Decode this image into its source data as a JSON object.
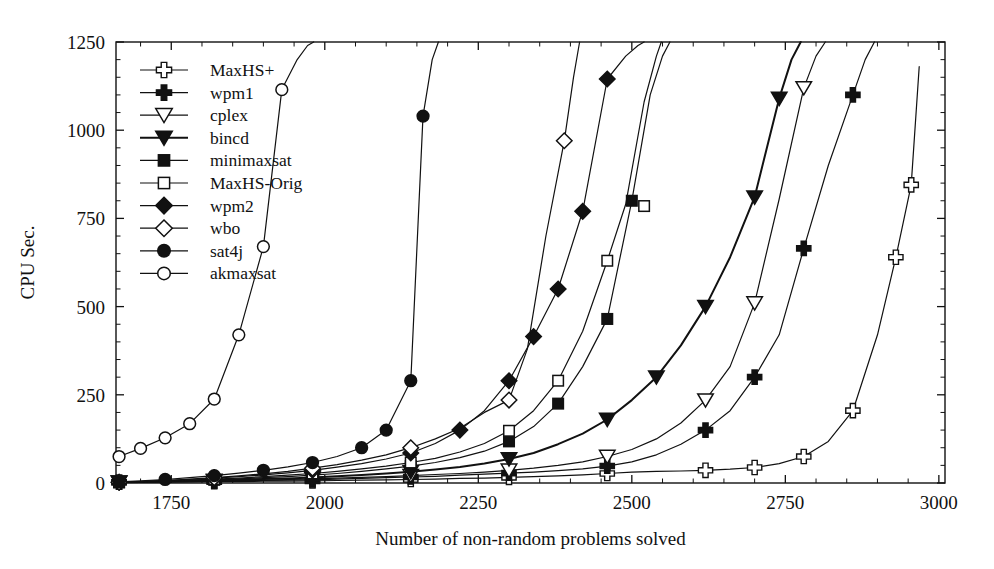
{
  "chart_data": {
    "type": "line",
    "title": "",
    "subtitle": "",
    "xlabel": "Number of non-random problems solved",
    "ylabel": "CPU Sec.",
    "xlim": [
      1660,
      3010
    ],
    "ylim": [
      0,
      1250
    ],
    "xticks": [
      1750,
      2000,
      2250,
      2500,
      2750,
      3000
    ],
    "yticks": [
      0,
      250,
      500,
      750,
      1000,
      1250
    ],
    "xtick_labels": [
      "1750",
      "2000",
      "2250",
      "2500",
      "2750",
      "3000"
    ],
    "ytick_labels": [
      "0",
      "250",
      "500",
      "750",
      "1000",
      "1250"
    ],
    "x_minor_step": 50,
    "y_minor_step": 50,
    "grid": false,
    "legend_position": "upper-left",
    "series": [
      {
        "name": "MaxHS+",
        "marker": "plus-open",
        "fill": "#ffffff",
        "stroke": "#111111",
        "x": [
          1665,
          1700,
          1740,
          1780,
          1820,
          1860,
          1900,
          1940,
          1980,
          2020,
          2060,
          2100,
          2140,
          2180,
          2220,
          2260,
          2300,
          2340,
          2380,
          2420,
          2460,
          2500,
          2540,
          2580,
          2620,
          2660,
          2700,
          2740,
          2780,
          2820,
          2860,
          2900,
          2930,
          2955,
          2968
        ],
        "y": [
          2,
          2,
          3,
          3,
          4,
          4,
          5,
          5,
          6,
          7,
          8,
          9,
          10,
          11,
          13,
          14,
          16,
          18,
          20,
          23,
          27,
          31,
          33,
          34,
          36,
          39,
          44,
          55,
          75,
          118,
          205,
          420,
          640,
          845,
          1180
        ],
        "markevery": [
          0,
          4,
          8,
          12,
          16,
          20,
          24,
          26,
          28,
          30,
          32,
          33
        ],
        "marker_points": [
          [
            1665,
            2
          ],
          [
            1820,
            4
          ],
          [
            1980,
            6
          ],
          [
            2140,
            10
          ],
          [
            2300,
            16
          ],
          [
            2460,
            27
          ],
          [
            2620,
            36
          ],
          [
            2700,
            44
          ],
          [
            2780,
            75
          ],
          [
            2860,
            205
          ],
          [
            2930,
            640
          ],
          [
            2955,
            845
          ]
        ]
      },
      {
        "name": "wpm1",
        "marker": "plus-filled",
        "fill": "#111111",
        "stroke": "#111111",
        "x": [
          1665,
          1700,
          1740,
          1780,
          1820,
          1860,
          1900,
          1940,
          1980,
          2020,
          2060,
          2100,
          2140,
          2180,
          2220,
          2260,
          2300,
          2340,
          2380,
          2420,
          2460,
          2500,
          2540,
          2580,
          2620,
          2660,
          2700,
          2740,
          2780,
          2820,
          2860,
          2880,
          2895
        ],
        "y": [
          2,
          3,
          3,
          4,
          5,
          6,
          7,
          8,
          9,
          11,
          13,
          15,
          17,
          19,
          22,
          25,
          28,
          31,
          35,
          40,
          48,
          60,
          80,
          110,
          150,
          205,
          300,
          420,
          665,
          900,
          1100,
          1200,
          1250
        ],
        "markevery": [
          0,
          4,
          8,
          12,
          16,
          20,
          24,
          26,
          28,
          30
        ],
        "marker_points": [
          [
            1665,
            2
          ],
          [
            1820,
            5
          ],
          [
            1980,
            9
          ],
          [
            2140,
            17
          ],
          [
            2300,
            28
          ],
          [
            2460,
            48
          ],
          [
            2620,
            150
          ],
          [
            2700,
            300
          ],
          [
            2780,
            665
          ],
          [
            2860,
            1100
          ]
        ]
      },
      {
        "name": "cplex",
        "marker": "triangle-down-open",
        "fill": "#ffffff",
        "stroke": "#111111",
        "x": [
          1665,
          1700,
          1740,
          1780,
          1820,
          1860,
          1900,
          1940,
          1980,
          2020,
          2060,
          2100,
          2140,
          2180,
          2220,
          2260,
          2300,
          2340,
          2380,
          2420,
          2460,
          2500,
          2540,
          2580,
          2620,
          2660,
          2700,
          2740,
          2780,
          2800,
          2815
        ],
        "y": [
          2,
          3,
          4,
          5,
          6,
          7,
          8,
          10,
          12,
          14,
          16,
          18,
          21,
          24,
          27,
          31,
          36,
          42,
          50,
          60,
          75,
          95,
          125,
          170,
          235,
          330,
          510,
          805,
          1120,
          1210,
          1250
        ],
        "markevery": [
          0,
          4,
          8,
          12,
          16,
          20,
          24,
          26,
          28
        ],
        "marker_points": [
          [
            1665,
            2
          ],
          [
            1820,
            6
          ],
          [
            1980,
            12
          ],
          [
            2140,
            21
          ],
          [
            2300,
            36
          ],
          [
            2460,
            75
          ],
          [
            2620,
            235
          ],
          [
            2700,
            510
          ],
          [
            2780,
            1120
          ]
        ]
      },
      {
        "name": "bincd",
        "marker": "triangle-down-filled",
        "fill": "#111111",
        "stroke": "#111111",
        "x": [
          1665,
          1700,
          1740,
          1780,
          1820,
          1860,
          1900,
          1940,
          1980,
          2020,
          2060,
          2100,
          2140,
          2180,
          2220,
          2260,
          2300,
          2340,
          2380,
          2420,
          2460,
          2500,
          2540,
          2580,
          2620,
          2660,
          2700,
          2740,
          2760,
          2775
        ],
        "y": [
          2,
          3,
          4,
          6,
          7,
          9,
          11,
          13,
          16,
          19,
          23,
          27,
          32,
          38,
          45,
          55,
          68,
          85,
          110,
          140,
          180,
          235,
          300,
          390,
          500,
          640,
          810,
          1090,
          1200,
          1250
        ],
        "markevery": [
          0,
          4,
          8,
          12,
          16,
          20,
          22,
          24,
          26,
          27
        ],
        "marker_points": [
          [
            1665,
            2
          ],
          [
            1820,
            7
          ],
          [
            1980,
            16
          ],
          [
            2140,
            32
          ],
          [
            2300,
            68
          ],
          [
            2460,
            180
          ],
          [
            2540,
            300
          ],
          [
            2620,
            500
          ],
          [
            2700,
            810
          ],
          [
            2740,
            1090
          ]
        ]
      },
      {
        "name": "minimaxsat",
        "marker": "square-filled",
        "fill": "#111111",
        "stroke": "#111111",
        "x": [
          1665,
          1700,
          1740,
          1780,
          1820,
          1860,
          1900,
          1940,
          1980,
          2020,
          2060,
          2100,
          2140,
          2180,
          2220,
          2260,
          2300,
          2340,
          2380,
          2420,
          2460,
          2500,
          2530,
          2550,
          2562
        ],
        "y": [
          2,
          3,
          5,
          7,
          9,
          12,
          15,
          18,
          22,
          27,
          33,
          40,
          48,
          58,
          72,
          90,
          118,
          160,
          225,
          330,
          465,
          800,
          1100,
          1210,
          1250
        ],
        "markevery": [
          0,
          4,
          8,
          12,
          16,
          18,
          20,
          21,
          22
        ],
        "marker_points": [
          [
            1665,
            2
          ],
          [
            1820,
            9
          ],
          [
            1980,
            22
          ],
          [
            2140,
            48
          ],
          [
            2300,
            118
          ],
          [
            2380,
            225
          ],
          [
            2460,
            465
          ],
          [
            2500,
            800
          ]
        ]
      },
      {
        "name": "MaxHS-Orig",
        "marker": "square-open",
        "fill": "#ffffff",
        "stroke": "#111111",
        "x": [
          1665,
          1700,
          1740,
          1780,
          1820,
          1860,
          1900,
          1940,
          1980,
          2020,
          2060,
          2100,
          2140,
          2180,
          2220,
          2260,
          2300,
          2340,
          2380,
          2420,
          2460,
          2490,
          2520,
          2540,
          2548
        ],
        "y": [
          2,
          4,
          6,
          8,
          11,
          14,
          18,
          22,
          27,
          33,
          40,
          48,
          58,
          70,
          88,
          112,
          148,
          205,
          290,
          430,
          630,
          790,
          1080,
          1210,
          1250
        ],
        "markevery": [
          0,
          4,
          8,
          12,
          16,
          18,
          20,
          22
        ],
        "marker_points": [
          [
            1665,
            2
          ],
          [
            1820,
            11
          ],
          [
            1980,
            27
          ],
          [
            2140,
            58
          ],
          [
            2300,
            148
          ],
          [
            2380,
            290
          ],
          [
            2460,
            630
          ],
          [
            2520,
            785
          ]
        ]
      },
      {
        "name": "wpm2",
        "marker": "diamond-filled",
        "fill": "#111111",
        "stroke": "#111111",
        "x": [
          1665,
          1700,
          1740,
          1780,
          1820,
          1860,
          1900,
          1940,
          1980,
          2020,
          2060,
          2100,
          2140,
          2180,
          2220,
          2260,
          2300,
          2340,
          2380,
          2420,
          2460,
          2490,
          2510,
          2520
        ],
        "y": [
          2,
          4,
          7,
          10,
          14,
          18,
          23,
          29,
          36,
          45,
          55,
          68,
          85,
          112,
          150,
          205,
          290,
          415,
          550,
          770,
          1145,
          1210,
          1240,
          1250
        ],
        "markevery": [
          0,
          4,
          8,
          12,
          14,
          16,
          17,
          18,
          19,
          20
        ],
        "marker_points": [
          [
            1665,
            2
          ],
          [
            1820,
            14
          ],
          [
            1980,
            36
          ],
          [
            2140,
            85
          ],
          [
            2220,
            150
          ],
          [
            2300,
            290
          ],
          [
            2340,
            415
          ],
          [
            2380,
            550
          ],
          [
            2420,
            770
          ],
          [
            2460,
            1145
          ]
        ]
      },
      {
        "name": "wbo",
        "marker": "diamond-open",
        "fill": "#ffffff",
        "stroke": "#111111",
        "x": [
          1665,
          1700,
          1740,
          1780,
          1820,
          1860,
          1900,
          1940,
          1980,
          2020,
          2060,
          2100,
          2140,
          2180,
          2220,
          2260,
          2300,
          2330,
          2360,
          2390,
          2405,
          2415
        ],
        "y": [
          2,
          4,
          7,
          11,
          15,
          20,
          26,
          33,
          42,
          52,
          65,
          80,
          100,
          125,
          155,
          200,
          235,
          380,
          700,
          970,
          1150,
          1250
        ],
        "markevery": [
          0,
          4,
          8,
          12,
          16,
          19
        ],
        "marker_points": [
          [
            1665,
            2
          ],
          [
            1820,
            15
          ],
          [
            1980,
            42
          ],
          [
            2140,
            100
          ],
          [
            2300,
            235
          ],
          [
            2390,
            970
          ]
        ]
      },
      {
        "name": "sat4j",
        "marker": "circle-filled",
        "fill": "#111111",
        "stroke": "#111111",
        "x": [
          1665,
          1700,
          1740,
          1780,
          1820,
          1860,
          1900,
          1940,
          1980,
          2020,
          2060,
          2100,
          2140,
          2160,
          2175,
          2185
        ],
        "y": [
          3,
          6,
          10,
          15,
          21,
          28,
          36,
          46,
          58,
          75,
          100,
          150,
          290,
          1040,
          1200,
          1250
        ],
        "markevery": [
          0,
          2,
          4,
          6,
          8,
          10,
          11,
          12,
          13
        ],
        "marker_points": [
          [
            1665,
            3
          ],
          [
            1740,
            10
          ],
          [
            1820,
            21
          ],
          [
            1900,
            36
          ],
          [
            1980,
            58
          ],
          [
            2060,
            100
          ],
          [
            2100,
            150
          ],
          [
            2140,
            290
          ],
          [
            2160,
            1040
          ]
        ]
      },
      {
        "name": "akmaxsat",
        "marker": "circle-open",
        "fill": "#ffffff",
        "stroke": "#111111",
        "x": [
          1665,
          1700,
          1740,
          1780,
          1820,
          1860,
          1900,
          1930,
          1955,
          1972,
          1982
        ],
        "y": [
          75,
          98,
          128,
          168,
          238,
          420,
          670,
          1115,
          1200,
          1240,
          1250
        ],
        "markevery": [
          0,
          1,
          2,
          3,
          4,
          5,
          6,
          7
        ],
        "marker_points": [
          [
            1665,
            75
          ],
          [
            1700,
            98
          ],
          [
            1740,
            128
          ],
          [
            1780,
            168
          ],
          [
            1820,
            238
          ],
          [
            1860,
            420
          ],
          [
            1900,
            670
          ],
          [
            1930,
            1115
          ]
        ]
      }
    ]
  },
  "legend": {
    "entries": [
      {
        "label": "MaxHS+",
        "marker": "plus-open"
      },
      {
        "label": "wpm1",
        "marker": "plus-filled"
      },
      {
        "label": "cplex",
        "marker": "triangle-down-open"
      },
      {
        "label": "bincd",
        "marker": "triangle-down-filled"
      },
      {
        "label": "minimaxsat",
        "marker": "square-filled"
      },
      {
        "label": "MaxHS-Orig",
        "marker": "square-open"
      },
      {
        "label": "wpm2",
        "marker": "diamond-filled"
      },
      {
        "label": "wbo",
        "marker": "diamond-open"
      },
      {
        "label": "sat4j",
        "marker": "circle-filled"
      },
      {
        "label": "akmaxsat",
        "marker": "circle-open"
      }
    ]
  },
  "colors": {
    "line": "#111111",
    "axis": "#111111",
    "background": "#ffffff",
    "marker_open_fill": "#ffffff",
    "marker_filled_fill": "#111111"
  }
}
